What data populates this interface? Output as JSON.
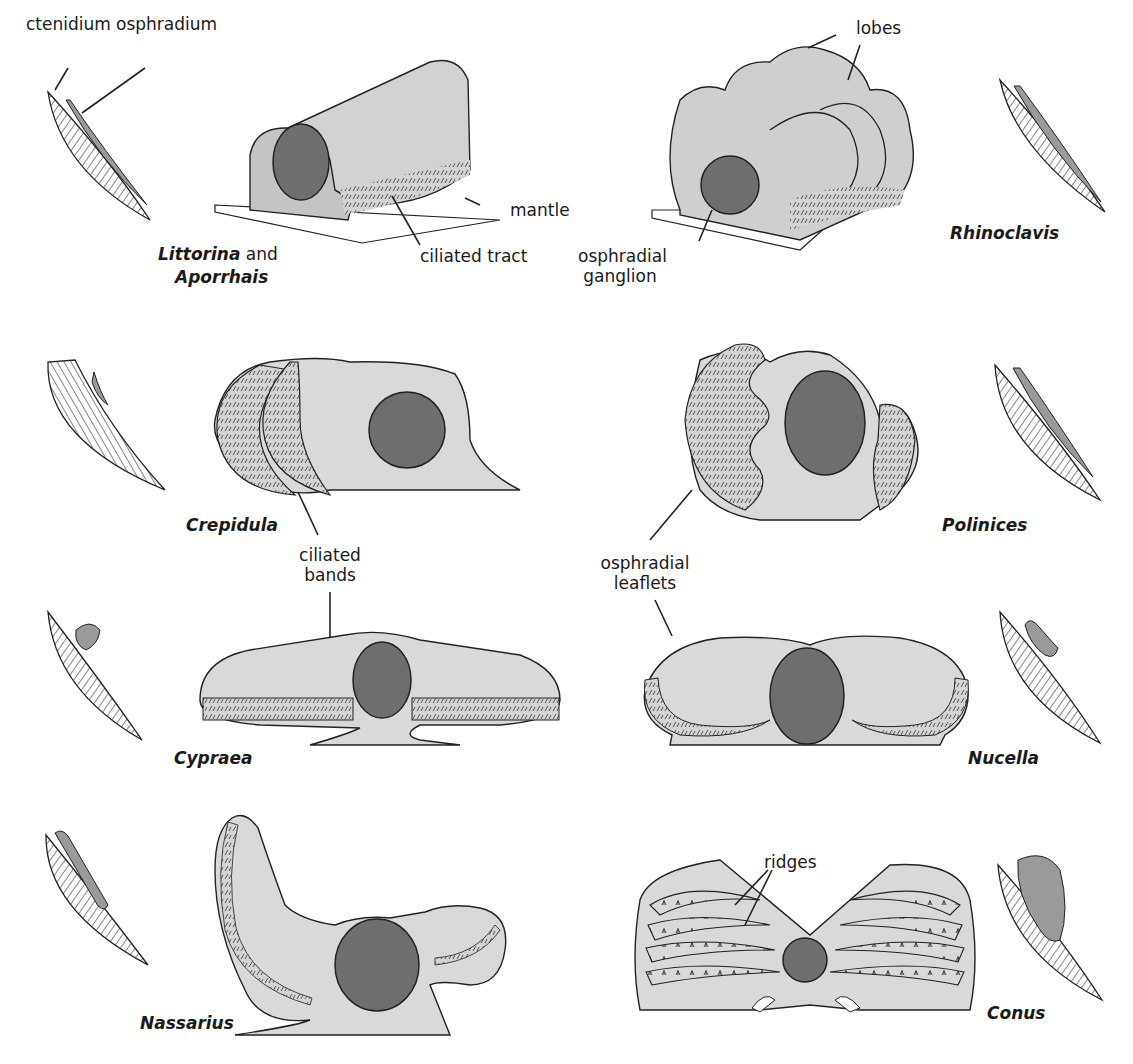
{
  "figure": {
    "colors": {
      "tissue": "#d9d9d9",
      "tissue_dark": "#bdbdbd",
      "ganglion": "#6e6e6e",
      "outline": "#1a1a1a",
      "mantle": "#ffffff",
      "osphradium_fill": "#9a9a9a"
    },
    "panels": [
      {
        "id": "littorina",
        "species": [
          "Littorina",
          "Aporrhais"
        ],
        "species_joiner": "and",
        "labels": {
          "ctenidium": "ctenidium",
          "osphradium": "osphradium",
          "mantle": "mantle",
          "ciliated_tract": "ciliated tract"
        }
      },
      {
        "id": "rhinoclavis",
        "species": [
          "Rhinoclavis"
        ],
        "labels": {
          "lobes": "lobes",
          "ganglion_line1": "osphradial",
          "ganglion_line2": "ganglion"
        }
      },
      {
        "id": "crepidula",
        "species": [
          "Crepidula"
        ],
        "labels": {
          "bands_line1": "ciliated",
          "bands_line2": "bands"
        }
      },
      {
        "id": "polinices",
        "species": [
          "Polinices"
        ],
        "labels": {
          "leaflets_line1": "osphradial",
          "leaflets_line2": "leaflets"
        }
      },
      {
        "id": "cypraea",
        "species": [
          "Cypraea"
        ],
        "labels": {}
      },
      {
        "id": "nucella",
        "species": [
          "Nucella"
        ],
        "labels": {}
      },
      {
        "id": "nassarius",
        "species": [
          "Nassarius"
        ],
        "labels": {}
      },
      {
        "id": "conus",
        "species": [
          "Conus"
        ],
        "labels": {
          "ridges": "ridges"
        }
      }
    ]
  }
}
